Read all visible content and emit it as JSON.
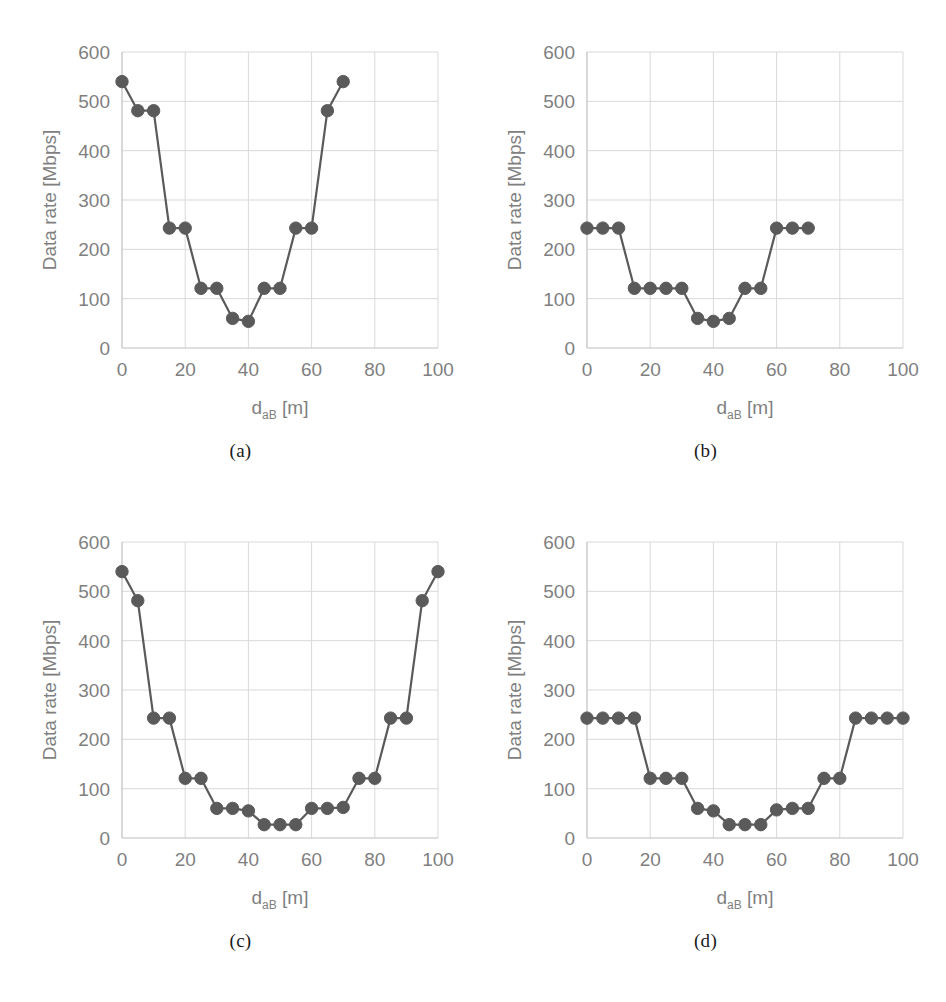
{
  "figure": {
    "background": "#ffffff",
    "series_color": "#5a5a5a",
    "grid_color": "#d9d9d9",
    "axis_color": "#bfbfbf",
    "tick_color": "#7f7f7f"
  },
  "axes_common": {
    "xlabel_main": "d",
    "xlabel_sub": "aB",
    "xlabel_unit": " [m]",
    "ylabel": "Data rate [Mbps]",
    "xticks": [
      0,
      20,
      40,
      60,
      80,
      100
    ],
    "yticks": [
      0,
      100,
      200,
      300,
      400,
      500,
      600
    ],
    "xlim": [
      0,
      100
    ],
    "ylim": [
      0,
      600
    ],
    "grid": true,
    "legend": "none"
  },
  "panels": [
    {
      "caption": "(a)",
      "chart_data": {
        "type": "line",
        "title": "",
        "xlabel": "d_aB [m]",
        "ylabel": "Data rate [Mbps]",
        "xlim": [
          0,
          100
        ],
        "ylim": [
          0,
          600
        ],
        "xticks": [
          0,
          20,
          40,
          60,
          80,
          100
        ],
        "yticks": [
          0,
          100,
          200,
          300,
          400,
          500,
          600
        ],
        "grid": true,
        "marker": "circle",
        "x": [
          0,
          5,
          10,
          15,
          20,
          25,
          30,
          35,
          40,
          45,
          50,
          55,
          60,
          65,
          70
        ],
        "values": [
          540,
          481,
          481,
          243,
          243,
          121,
          121,
          60,
          54,
          121,
          121,
          243,
          243,
          481,
          540
        ]
      }
    },
    {
      "caption": "(b)",
      "chart_data": {
        "type": "line",
        "title": "",
        "xlabel": "d_aB [m]",
        "ylabel": "Data rate [Mbps]",
        "xlim": [
          0,
          100
        ],
        "ylim": [
          0,
          600
        ],
        "xticks": [
          0,
          20,
          40,
          60,
          80,
          100
        ],
        "yticks": [
          0,
          100,
          200,
          300,
          400,
          500,
          600
        ],
        "grid": true,
        "marker": "circle",
        "x": [
          0,
          5,
          10,
          15,
          20,
          25,
          30,
          35,
          40,
          45,
          50,
          55,
          60,
          65,
          70
        ],
        "values": [
          243,
          243,
          243,
          121,
          121,
          121,
          121,
          60,
          54,
          60,
          121,
          121,
          243,
          243,
          243
        ]
      }
    },
    {
      "caption": "(c)",
      "chart_data": {
        "type": "line",
        "title": "",
        "xlabel": "d_aB [m]",
        "ylabel": "Data rate [Mbps]",
        "xlim": [
          0,
          100
        ],
        "ylim": [
          0,
          600
        ],
        "xticks": [
          0,
          20,
          40,
          60,
          80,
          100
        ],
        "yticks": [
          0,
          100,
          200,
          300,
          400,
          500,
          600
        ],
        "grid": true,
        "marker": "circle",
        "x": [
          0,
          5,
          10,
          15,
          20,
          25,
          30,
          35,
          40,
          45,
          50,
          55,
          60,
          65,
          70,
          75,
          80,
          85,
          90,
          95,
          100
        ],
        "values": [
          540,
          481,
          243,
          243,
          121,
          121,
          60,
          60,
          55,
          27,
          27,
          27,
          60,
          60,
          62,
          121,
          121,
          243,
          243,
          481,
          540
        ]
      }
    },
    {
      "caption": "(d)",
      "chart_data": {
        "type": "line",
        "title": "",
        "xlabel": "d_aB [m]",
        "ylabel": "Data rate [Mbps]",
        "xlim": [
          0,
          100
        ],
        "ylim": [
          0,
          600
        ],
        "xticks": [
          0,
          20,
          40,
          60,
          80,
          100
        ],
        "yticks": [
          0,
          100,
          200,
          300,
          400,
          500,
          600
        ],
        "grid": true,
        "marker": "circle",
        "x": [
          0,
          5,
          10,
          15,
          20,
          25,
          30,
          35,
          40,
          45,
          50,
          55,
          60,
          65,
          70,
          75,
          80,
          85,
          90,
          95,
          100
        ],
        "values": [
          243,
          243,
          243,
          243,
          121,
          121,
          121,
          60,
          55,
          27,
          27,
          27,
          57,
          60,
          60,
          121,
          121,
          243,
          243,
          243,
          243
        ]
      }
    }
  ]
}
